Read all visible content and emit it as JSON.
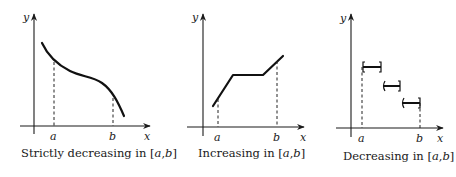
{
  "figure": {
    "panels": [
      {
        "id": "strictly-decreasing",
        "caption_prefix": "Strictly decreasing in ",
        "caption_interval_open": "[",
        "caption_a": "a",
        "caption_comma": ",",
        "caption_b": "b",
        "caption_interval_close": "]",
        "y_label": "y",
        "x_label": "x",
        "a_label": "a",
        "b_label": "b"
      },
      {
        "id": "increasing",
        "caption_prefix": "Increasing in ",
        "caption_interval_open": "[",
        "caption_a": "a",
        "caption_comma": ",",
        "caption_b": "b",
        "caption_interval_close": "]",
        "y_label": "y",
        "x_label": "x",
        "a_label": "a",
        "b_label": "b"
      },
      {
        "id": "decreasing-step",
        "caption_prefix": "Decreasing in ",
        "caption_interval_open": "[",
        "caption_a": "a",
        "caption_comma": ",",
        "caption_b": "b",
        "caption_interval_close": "]",
        "y_label": "y",
        "x_label": "x",
        "a_label": "a",
        "b_label": "b"
      }
    ],
    "colors": {
      "ink": "#111111",
      "background": "#ffffff"
    }
  }
}
